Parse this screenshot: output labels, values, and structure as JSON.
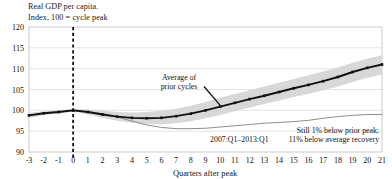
{
  "chart_data": {
    "type": "line",
    "title": "Real GDP per capita.\nIndex, 100 = cycle peak",
    "title_line_1": "Real GDP per capita.",
    "title_line_2": "Index, 100 = cycle peak",
    "xlabel": "Quarters after peak",
    "ylabel": "",
    "ylim": [
      90,
      120
    ],
    "xlim": [
      -3,
      21
    ],
    "yticks": [
      90,
      95,
      100,
      105,
      110,
      115,
      120
    ],
    "xticks": [
      -3,
      -2,
      -1,
      0,
      1,
      2,
      3,
      4,
      5,
      6,
      7,
      8,
      9,
      10,
      11,
      12,
      13,
      14,
      15,
      16,
      17,
      18,
      19,
      20,
      21
    ],
    "grid": true,
    "legend_position": "inline-annotations",
    "x": [
      -3,
      -2,
      -1,
      0,
      1,
      2,
      3,
      4,
      5,
      6,
      7,
      8,
      9,
      10,
      11,
      12,
      13,
      14,
      15,
      16,
      17,
      18,
      19,
      20,
      21
    ],
    "series": [
      {
        "name": "Average of prior cycles",
        "style": "thick-black-line-with-markers",
        "color": "#111111",
        "values": [
          98.8,
          99.3,
          99.6,
          100.0,
          99.6,
          99.0,
          98.5,
          98.2,
          98.1,
          98.2,
          98.6,
          99.2,
          100.0,
          100.9,
          101.8,
          102.7,
          103.5,
          104.4,
          105.3,
          106.1,
          107.0,
          108.0,
          109.2,
          110.2,
          111.0
        ]
      },
      {
        "name": "Average of prior cycles range band",
        "style": "gray-shaded-band",
        "color": "#d6d6d6",
        "upper": [
          99.4,
          99.8,
          100.0,
          100.3,
          100.2,
          99.9,
          99.6,
          99.5,
          99.6,
          99.9,
          100.4,
          101.1,
          102.0,
          103.0,
          103.9,
          104.8,
          105.7,
          106.6,
          107.5,
          108.4,
          109.3,
          110.3,
          111.4,
          112.4,
          113.2
        ],
        "lower": [
          98.2,
          98.8,
          99.2,
          99.7,
          99.0,
          98.2,
          97.5,
          97.0,
          96.7,
          96.6,
          96.9,
          97.4,
          98.1,
          98.9,
          99.8,
          100.7,
          101.5,
          102.3,
          103.2,
          104.0,
          104.8,
          105.7,
          106.8,
          107.8,
          108.6
        ]
      },
      {
        "name": "2007:Q1-2013:Q1",
        "style": "thin-gray-line",
        "color": "#808080",
        "values": [
          98.8,
          99.3,
          99.6,
          100.0,
          99.7,
          99.2,
          98.4,
          97.4,
          96.5,
          95.9,
          95.6,
          95.6,
          95.7,
          96.0,
          96.3,
          96.6,
          96.9,
          97.1,
          97.3,
          97.6,
          98.1,
          98.5,
          98.8,
          99.0,
          99.0
        ]
      }
    ],
    "annotations": [
      {
        "name": "average-of-prior-cycles-label",
        "text_line_1": "Average of",
        "text_line_2": "prior cycles",
        "x_data": 7.2,
        "y_data": 107.4
      },
      {
        "name": "recession-period-label",
        "text": "2007:Q1–2013:Q1",
        "x_data": 11.3,
        "y_data": 92.4
      },
      {
        "name": "shortfall-label",
        "text_line_1": "Still 1% below prior peak;",
        "text_line_2": "11% below average recovery",
        "x_data": 20.8,
        "y_data": 94.5
      }
    ],
    "peak_marker": {
      "name": "cycle-peak-dashed-line",
      "x_data": 0,
      "style": "dashed-vertical"
    },
    "colors": {
      "line": "#111111",
      "band": "#d6d6d6",
      "recession_line": "#808080",
      "grid": "#d9d9d9",
      "frame": "#bfbfbf",
      "background": "#ffffff"
    }
  }
}
